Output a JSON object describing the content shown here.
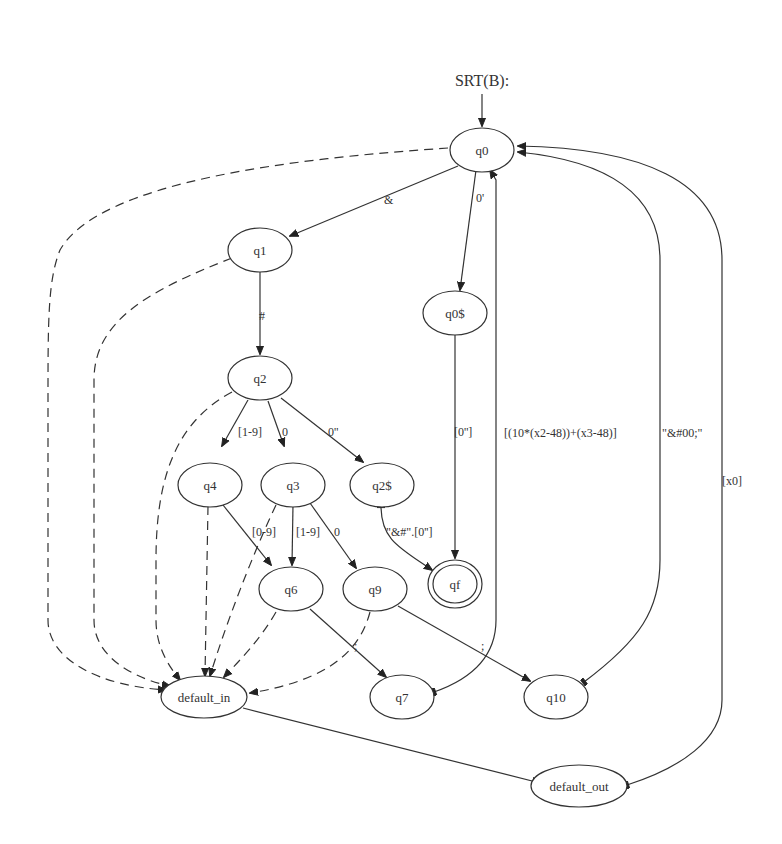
{
  "diagram": {
    "title": "SRT(B):",
    "type": "finite-state-automaton",
    "nodes": {
      "q0": "q0",
      "q1": "q1",
      "q2": "q2",
      "q0s": "q0$",
      "q2s": "q2$",
      "q3": "q3",
      "q4": "q4",
      "q6": "q6",
      "q7": "q7",
      "q9": "q9",
      "q10": "q10",
      "qf": "qf",
      "default_in": "default_in",
      "default_out": "default_out"
    },
    "accepting_states": [
      "qf"
    ],
    "edges": [
      {
        "from": "start",
        "to": "q0",
        "label": "",
        "style": "solid"
      },
      {
        "from": "q0",
        "to": "q1",
        "label": "&",
        "style": "solid"
      },
      {
        "from": "q0",
        "to": "q0$",
        "label": "0'",
        "style": "solid"
      },
      {
        "from": "q1",
        "to": "q2",
        "label": "#",
        "style": "solid"
      },
      {
        "from": "q2",
        "to": "q4",
        "label": "[1-9]",
        "style": "solid"
      },
      {
        "from": "q2",
        "to": "q3",
        "label": "0",
        "style": "solid"
      },
      {
        "from": "q2",
        "to": "q2$",
        "label": "0''",
        "style": "solid"
      },
      {
        "from": "q0$",
        "to": "qf",
        "label": "[0'']",
        "style": "solid"
      },
      {
        "from": "q2$",
        "to": "qf",
        "label": "\"&#\".[0'']",
        "style": "solid"
      },
      {
        "from": "q4",
        "to": "q6",
        "label": "[0-9]",
        "style": "solid"
      },
      {
        "from": "q3",
        "to": "q6",
        "label": "[1-9]",
        "style": "solid"
      },
      {
        "from": "q3",
        "to": "q9",
        "label": "0",
        "style": "solid"
      },
      {
        "from": "q6",
        "to": "q7",
        "label": ";",
        "style": "solid"
      },
      {
        "from": "q9",
        "to": "q10",
        "label": ";",
        "style": "solid"
      },
      {
        "from": "q7",
        "to": "q0",
        "label": "[(10*(x2-48))+(x3-48)]",
        "style": "solid"
      },
      {
        "from": "q10",
        "to": "q0",
        "label": "\"&#00;\"",
        "style": "solid"
      },
      {
        "from": "default_out",
        "to": "q0",
        "label": "[x0]",
        "style": "solid"
      },
      {
        "from": "default_in",
        "to": "default_out",
        "label": "",
        "style": "solid"
      },
      {
        "from": "q0",
        "to": "default_in",
        "label": "",
        "style": "dashed"
      },
      {
        "from": "q1",
        "to": "default_in",
        "label": "",
        "style": "dashed"
      },
      {
        "from": "q2",
        "to": "default_in",
        "label": "",
        "style": "dashed"
      },
      {
        "from": "q4",
        "to": "default_in",
        "label": "",
        "style": "dashed"
      },
      {
        "from": "q3",
        "to": "default_in",
        "label": "",
        "style": "dashed"
      },
      {
        "from": "q6",
        "to": "default_in",
        "label": "",
        "style": "dashed"
      },
      {
        "from": "q9",
        "to": "default_in",
        "label": "",
        "style": "dashed"
      }
    ],
    "labels": {
      "amp": "&",
      "zero_prime": "0'",
      "hash": "#",
      "one_nine": "[1-9]",
      "zero": "0",
      "zero_dprime": "0''",
      "bracket_zero_dprime": "[0'']",
      "amp_hash_concat": "\"&#\".[0'']",
      "zero_nine": "[0-9]",
      "one_nine_b": "[1-9]",
      "zero_b": "0",
      "semicolon_a": ";",
      "semicolon_b": ";",
      "formula": "[(10*(x2-48))+(x3-48)]",
      "amp_hash_00": "\"&#00;\"",
      "x0": "[x0]"
    }
  }
}
